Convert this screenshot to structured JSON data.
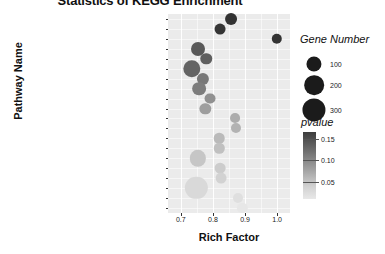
{
  "chart_data": {
    "type": "scatter",
    "title": "Statistics of KEGG Enrichment",
    "xlabel": "Rich Factor",
    "ylabel": "Pathway Name",
    "xlim": [
      0.66,
      1.04
    ],
    "xticks": [
      0.7,
      0.8,
      0.9,
      1.0
    ],
    "xticklabels": [
      "0.7",
      "0.8",
      "0.9",
      "1.0"
    ],
    "grid": true,
    "legend_position": "right",
    "size_legend": {
      "title": "Gene Number",
      "values": [
        100,
        200,
        300
      ],
      "labels": [
        "100",
        "200",
        "300"
      ]
    },
    "color_legend": {
      "title": "pvalue",
      "ticks": [
        0.15,
        0.1,
        0.05
      ],
      "ticklabels": [
        "0.15",
        "0.10",
        "0.05"
      ],
      "low_color": "#efefef",
      "high_color": "#333333"
    },
    "categories": [
      "Fatty acid biosynthesis",
      "Photosynthesis - antenna proteins",
      "Phenylalanine metabolism",
      "Nucleotide excision repair",
      "Glycosphingolipid biosynthesis - ganglio series",
      "Ribosome biogenesis in eukaryotes",
      "Pyruvate metabolism",
      "Glutathione metabolism",
      "Ubiquinone and other terpenoid-quinone biosynthesis",
      "Photosynthesis",
      "Fructose and mannose metabolism",
      "Butanoate metabolism",
      "Brassinosteroid biosynthesis",
      "Vitamin B6 metabolism",
      "Amino sugar and nucleotide sugar metabolism",
      "Phagosome",
      "Stilbenoid, diarylheptanoid and gingerol biosynthesis",
      "Spliceosome",
      "Isoquinoline alkaloid biosynthesis",
      "Sesquiterpenoid and triterpenoid biosynthesis"
    ],
    "points": [
      {
        "pathway": "Fatty acid biosynthesis",
        "rich_factor": 0.855,
        "gene_number": 58,
        "pvalue": 0.15
      },
      {
        "pathway": "Photosynthesis - antenna proteins",
        "rich_factor": 0.822,
        "gene_number": 44,
        "pvalue": 0.148
      },
      {
        "pathway": "Phenylalanine metabolism",
        "rich_factor": 0.998,
        "gene_number": 38,
        "pvalue": 0.15
      },
      {
        "pathway": "Nucleotide excision repair",
        "rich_factor": 0.752,
        "gene_number": 92,
        "pvalue": 0.118
      },
      {
        "pathway": "Glycosphingolipid biosynthesis - ganglio series",
        "rich_factor": 0.779,
        "gene_number": 52,
        "pvalue": 0.112
      },
      {
        "pathway": "Ribosome biogenesis in eukaryotes",
        "rich_factor": 0.735,
        "gene_number": 165,
        "pvalue": 0.108
      },
      {
        "pathway": "Pyruvate metabolism",
        "rich_factor": 0.768,
        "gene_number": 62,
        "pvalue": 0.092
      },
      {
        "pathway": "Glutathione metabolism",
        "rich_factor": 0.756,
        "gene_number": 88,
        "pvalue": 0.088
      },
      {
        "pathway": "Ubiquinone and other terpenoid-quinone biosynthesis",
        "rich_factor": 0.79,
        "gene_number": 44,
        "pvalue": 0.072
      },
      {
        "pathway": "Photosynthesis",
        "rich_factor": 0.776,
        "gene_number": 50,
        "pvalue": 0.062
      },
      {
        "pathway": "Fructose and mannose metabolism",
        "rich_factor": 0.87,
        "gene_number": 32,
        "pvalue": 0.052
      },
      {
        "pathway": "Butanoate metabolism",
        "rich_factor": 0.872,
        "gene_number": 34,
        "pvalue": 0.048
      },
      {
        "pathway": "Brassinosteroid biosynthesis",
        "rich_factor": 0.82,
        "gene_number": 40,
        "pvalue": 0.042
      },
      {
        "pathway": "Vitamin B6 metabolism",
        "rich_factor": 0.82,
        "gene_number": 38,
        "pvalue": 0.038
      },
      {
        "pathway": "Amino sugar and nucleotide sugar metabolism",
        "rich_factor": 0.752,
        "gene_number": 140,
        "pvalue": 0.034
      },
      {
        "pathway": "Phagosome",
        "rich_factor": 0.822,
        "gene_number": 42,
        "pvalue": 0.03
      },
      {
        "pathway": "Stilbenoid, diarylheptanoid and gingerol biosynthesis",
        "rich_factor": 0.824,
        "gene_number": 44,
        "pvalue": 0.026
      },
      {
        "pathway": "Spliceosome",
        "rich_factor": 0.748,
        "gene_number": 310,
        "pvalue": 0.022
      },
      {
        "pathway": "Isoquinoline alkaloid biosynthesis",
        "rich_factor": 0.878,
        "gene_number": 34,
        "pvalue": 0.018
      },
      {
        "pathway": "Sesquiterpenoid and triterpenoid biosynthesis",
        "rich_factor": 0.892,
        "gene_number": 36,
        "pvalue": 0.014
      }
    ]
  }
}
